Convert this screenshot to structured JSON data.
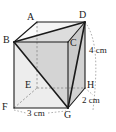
{
  "figure": {
    "type": "geometry-diagram",
    "shape": "cuboid-with-inscribed-triangular-solid",
    "vertices": [
      {
        "name": "A",
        "x": 37,
        "y": 22,
        "label_x": 27,
        "label_y": 12,
        "hidden": true
      },
      {
        "name": "B",
        "x": 14,
        "y": 42,
        "label_x": 4,
        "label_y": 36,
        "hidden": false
      },
      {
        "name": "C",
        "x": 68,
        "y": 42,
        "label_x": 70,
        "label_y": 40,
        "hidden": false
      },
      {
        "name": "D",
        "x": 85,
        "y": 22,
        "label_x": 79,
        "label_y": 10,
        "hidden": false
      },
      {
        "name": "E",
        "x": 37,
        "y": 88,
        "label_x": 26,
        "label_y": 80,
        "hidden": true
      },
      {
        "name": "F",
        "x": 14,
        "y": 108,
        "label_x": 3,
        "label_y": 104,
        "hidden": false
      },
      {
        "name": "G",
        "x": 68,
        "y": 108,
        "label_x": 65,
        "label_y": 112,
        "hidden": false
      },
      {
        "name": "H",
        "x": 85,
        "y": 88,
        "label_x": 87,
        "label_y": 82,
        "hidden": false
      }
    ],
    "dimensions": [
      {
        "id": "height",
        "value": "4 cm",
        "label_x": 88,
        "label_y": 46
      },
      {
        "id": "depth",
        "value": "2 cm",
        "label_x": 84,
        "label_y": 97
      },
      {
        "id": "width",
        "value": "3 cm",
        "label_x": 29,
        "label_y": 112
      }
    ],
    "colors": {
      "stroke": "#1a1a1a",
      "hidden_stroke": "#7a7a7a",
      "face_light": "#f2f2f2",
      "face_mid": "#dcdcdc",
      "face_dark": "#bdbdbd",
      "shaded": "#cfcfcf",
      "background": "#ffffff"
    }
  }
}
